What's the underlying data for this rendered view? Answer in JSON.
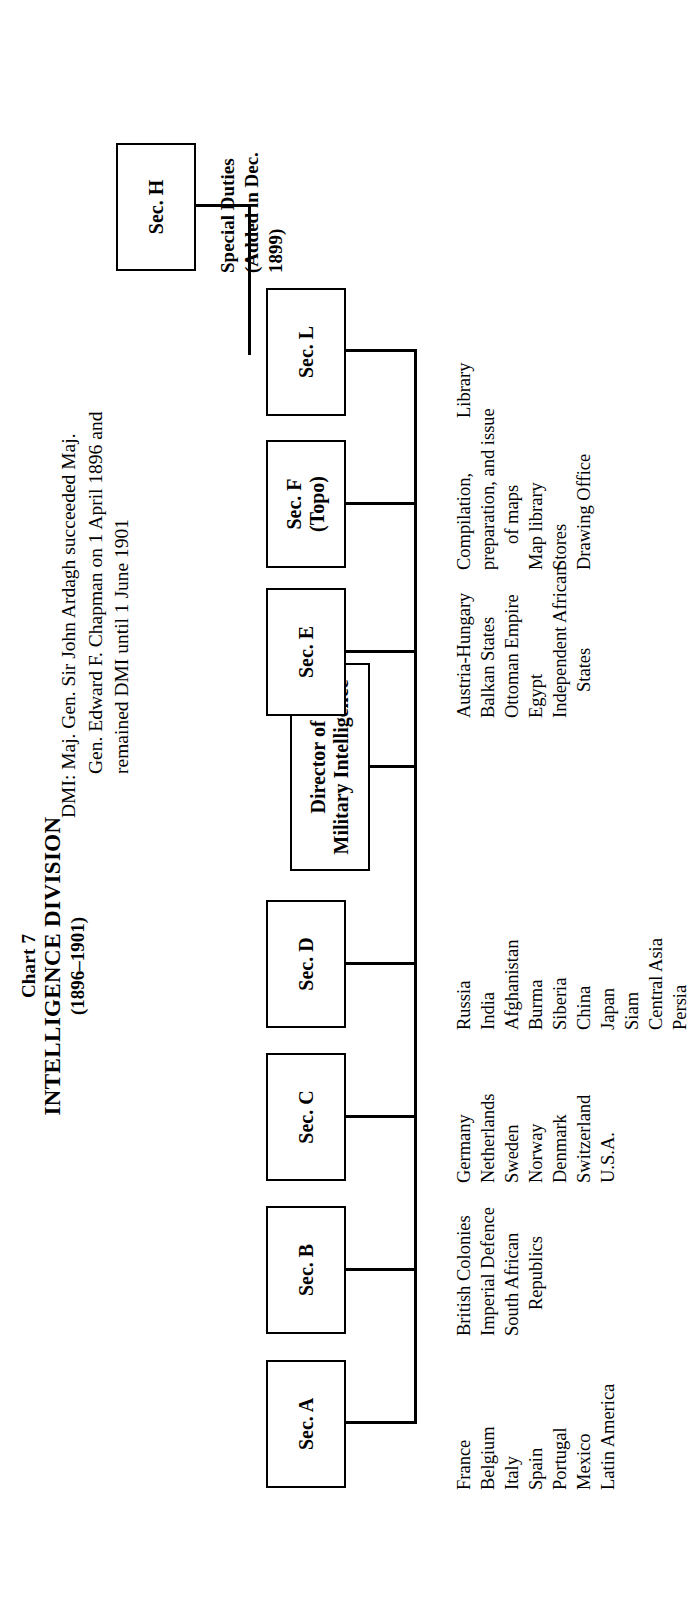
{
  "title": {
    "chart_number": "Chart 7",
    "name": "INTELLIGENCE DIVISION",
    "period": "(1896–1901)"
  },
  "dmi_note": {
    "line1": "DMI: Maj. Gen. Sir John Ardagh succeeded Maj.",
    "line2": "Gen. Edward F. Chapman on 1 April 1896 and",
    "line3": "remained DMI until 1 June 1901"
  },
  "root": {
    "label_line1": "Director of",
    "label_line2": "Military Intelligence"
  },
  "sections": [
    {
      "id": "a",
      "label_line1": "Sec. A",
      "label_line2": "",
      "items": [
        "France",
        "Belgium",
        "Italy",
        "Spain",
        "Portugal",
        "Mexico",
        "Latin America"
      ]
    },
    {
      "id": "b",
      "label_line1": "Sec. B",
      "label_line2": "",
      "items": [
        "British Colonies",
        "Imperial Defence",
        "South African",
        "Republics"
      ]
    },
    {
      "id": "c",
      "label_line1": "Sec. C",
      "label_line2": "",
      "items": [
        "Germany",
        "Netherlands",
        "Sweden",
        "Norway",
        "Denmark",
        "Switzerland",
        "U.S.A."
      ]
    },
    {
      "id": "d",
      "label_line1": "Sec. D",
      "label_line2": "",
      "items": [
        "Russia",
        "India",
        "Afghanistan",
        "Burma",
        "Siberia",
        "China",
        "Japan",
        "Siam",
        "Central Asia",
        "Persia"
      ]
    },
    {
      "id": "e",
      "label_line1": "Sec. E",
      "label_line2": "",
      "items": [
        "Austria-Hungary",
        "Balkan States",
        "Ottoman Empire",
        "Egypt",
        "Independent African",
        "States"
      ]
    },
    {
      "id": "f",
      "label_line1": "Sec. F",
      "label_line2": "(Topo)",
      "items": [
        "Compilation,",
        "preparation, and issue",
        "of maps",
        "Map library",
        "Stores",
        "Drawing Office"
      ]
    },
    {
      "id": "l",
      "label_line1": "Sec. L",
      "label_line2": "",
      "items": [
        "Library"
      ]
    },
    {
      "id": "h",
      "label_line1": "Sec. H",
      "label_line2": "",
      "items": [
        "Special Duties",
        "(Added in Dec.",
        "1899)"
      ]
    }
  ]
}
